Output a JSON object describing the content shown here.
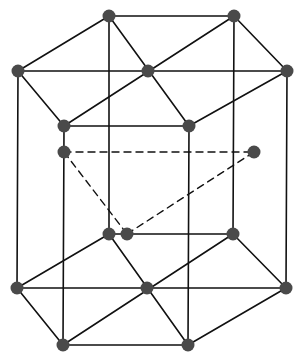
{
  "diagram": {
    "colors": {
      "edge": "#111111",
      "atom": "#4a4a4a",
      "background": "#ffffff"
    },
    "atom_radius": 6.5,
    "atoms": [
      {
        "id": "top-back-left",
        "x": 109,
        "y": 16
      },
      {
        "id": "top-back-right",
        "x": 234,
        "y": 16
      },
      {
        "id": "top-left",
        "x": 18,
        "y": 71
      },
      {
        "id": "top-center",
        "x": 148,
        "y": 71
      },
      {
        "id": "top-right",
        "x": 287,
        "y": 71
      },
      {
        "id": "top-front-left",
        "x": 64,
        "y": 126
      },
      {
        "id": "top-front-right",
        "x": 189,
        "y": 126
      },
      {
        "id": "mid-left",
        "x": 64,
        "y": 152
      },
      {
        "id": "mid-right",
        "x": 254,
        "y": 152
      },
      {
        "id": "mid-back",
        "x": 127,
        "y": 234
      },
      {
        "id": "bot-back-left",
        "x": 109,
        "y": 234
      },
      {
        "id": "bot-back-right",
        "x": 233,
        "y": 234
      },
      {
        "id": "bot-left",
        "x": 17,
        "y": 288
      },
      {
        "id": "bot-center",
        "x": 147,
        "y": 288
      },
      {
        "id": "bot-right",
        "x": 286,
        "y": 288
      },
      {
        "id": "bot-front-left",
        "x": 63,
        "y": 345
      },
      {
        "id": "bot-front-right",
        "x": 188,
        "y": 345
      }
    ],
    "solid_edges": [
      [
        "top-back-left",
        "top-back-right"
      ],
      [
        "top-back-right",
        "top-right"
      ],
      [
        "top-right",
        "top-front-right"
      ],
      [
        "top-front-right",
        "top-front-left"
      ],
      [
        "top-front-left",
        "top-left"
      ],
      [
        "top-left",
        "top-back-left"
      ],
      [
        "top-left",
        "top-right"
      ],
      [
        "top-back-left",
        "top-front-right"
      ],
      [
        "top-back-right",
        "top-front-left"
      ],
      [
        "bot-back-left",
        "bot-back-right"
      ],
      [
        "bot-back-right",
        "bot-right"
      ],
      [
        "bot-right",
        "bot-front-right"
      ],
      [
        "bot-front-right",
        "bot-front-left"
      ],
      [
        "bot-front-left",
        "bot-left"
      ],
      [
        "bot-left",
        "bot-back-left"
      ],
      [
        "bot-left",
        "bot-right"
      ],
      [
        "bot-back-left",
        "bot-front-right"
      ],
      [
        "bot-back-right",
        "bot-front-left"
      ],
      [
        "top-left",
        "bot-left"
      ],
      [
        "top-front-left",
        "bot-front-left"
      ],
      [
        "top-back-left",
        "bot-back-left"
      ],
      [
        "top-front-right",
        "bot-front-right"
      ],
      [
        "top-back-right",
        "bot-back-right"
      ],
      [
        "top-right",
        "bot-right"
      ]
    ],
    "dashed_edges": [
      [
        "mid-left",
        "mid-right"
      ],
      [
        "mid-left",
        "mid-back"
      ],
      [
        "mid-back",
        "mid-right"
      ]
    ]
  }
}
